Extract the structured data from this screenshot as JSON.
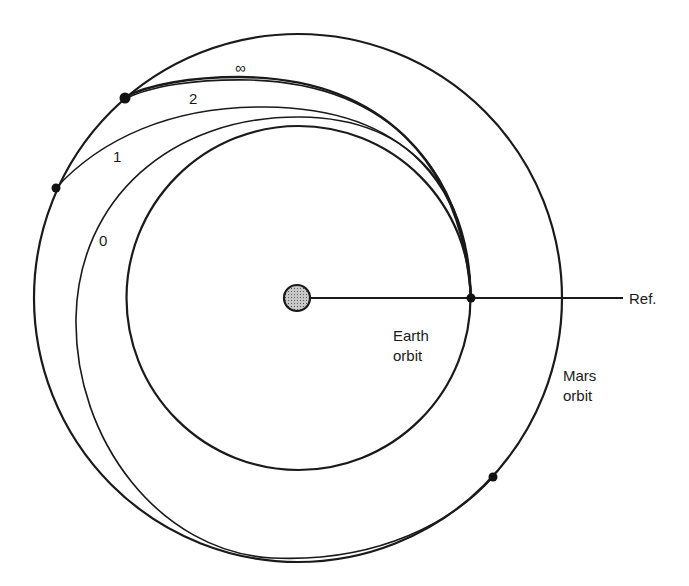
{
  "diagram": {
    "title": "",
    "sun": {
      "name": "Sun",
      "fill": "#a9a9a9",
      "stroke": "#1a1a1a"
    },
    "reference": {
      "label": "Ref."
    },
    "orbits": {
      "earth": {
        "label_line1": "Earth",
        "label_line2": "orbit"
      },
      "mars": {
        "label_line1": "Mars",
        "label_line2": "orbit"
      }
    },
    "transfer_trajectories": [
      {
        "label": "0",
        "description": "tangent to Mars orbit (lower right)"
      },
      {
        "label": "1",
        "description": "meets Mars orbit at left"
      },
      {
        "label": "2",
        "description": "meets Mars orbit at upper left"
      },
      {
        "label": "∞",
        "description": "limiting trajectory, meets Mars orbit at upper left"
      }
    ],
    "markers": [
      {
        "name": "departure-point-earth"
      },
      {
        "name": "arrival-point-0"
      },
      {
        "name": "arrival-point-1"
      },
      {
        "name": "arrival-point-2-infinity"
      }
    ]
  }
}
